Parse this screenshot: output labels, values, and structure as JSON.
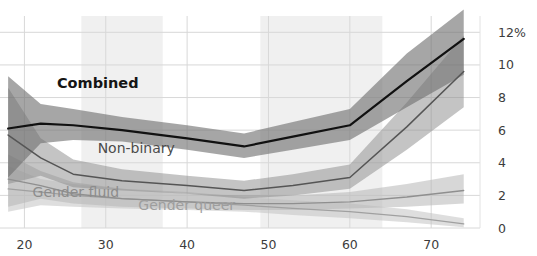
{
  "chart_data": {
    "type": "line",
    "title": "",
    "subtitle": "",
    "xlabel": "",
    "ylabel": "",
    "xlim": [
      17,
      76
    ],
    "ylim": [
      0,
      13
    ],
    "grid": true,
    "legend_position": "inline-labels",
    "y_ticks": [
      {
        "value": 12,
        "label": "12%"
      },
      {
        "value": 10,
        "label": "10"
      },
      {
        "value": 8,
        "label": "8"
      },
      {
        "value": 6,
        "label": "6"
      },
      {
        "value": 4,
        "label": "4"
      },
      {
        "value": 2,
        "label": "2"
      },
      {
        "value": 0,
        "label": "0"
      }
    ],
    "x_ticks": [
      {
        "value": 20,
        "label": "20"
      },
      {
        "value": 30,
        "label": "30"
      },
      {
        "value": 40,
        "label": "40"
      },
      {
        "value": 50,
        "label": "50"
      },
      {
        "value": 60,
        "label": "60"
      },
      {
        "value": 70,
        "label": "70"
      }
    ],
    "shaded_x_bands": [
      {
        "from": 27,
        "to": 37
      },
      {
        "from": 49,
        "to": 64
      }
    ],
    "x": [
      18,
      22,
      26,
      32,
      40,
      47,
      53,
      60,
      67,
      74
    ],
    "series": [
      {
        "name": "Combined",
        "label": "Combined",
        "color": "#111111",
        "stroke_width": 2.2,
        "band_color": "#6f6f6f",
        "band_opacity": 0.62,
        "label_x": 24,
        "label_y": 8.6,
        "values": [
          6.1,
          6.4,
          6.3,
          6.0,
          5.5,
          5.0,
          5.6,
          6.3,
          9.0,
          11.6
        ],
        "band_low": [
          3.1,
          5.2,
          5.4,
          5.3,
          4.8,
          4.3,
          4.8,
          5.4,
          7.4,
          9.4
        ],
        "band_high": [
          9.3,
          7.6,
          7.3,
          6.8,
          6.3,
          5.8,
          6.5,
          7.3,
          10.7,
          13.4
        ]
      },
      {
        "name": "Non-binary",
        "label": "Non-binary",
        "color": "#555555",
        "stroke_width": 1.5,
        "band_color": "#8a8a8a",
        "band_opacity": 0.5,
        "label_x": 29,
        "label_y": 4.6,
        "values": [
          5.7,
          4.3,
          3.3,
          2.9,
          2.6,
          2.3,
          2.6,
          3.1,
          6.2,
          9.6
        ],
        "band_low": [
          2.7,
          3.2,
          2.5,
          2.3,
          2.1,
          1.8,
          2.0,
          2.4,
          4.8,
          7.4
        ],
        "band_high": [
          8.6,
          5.5,
          4.2,
          3.6,
          3.2,
          2.9,
          3.3,
          3.9,
          7.7,
          11.8
        ]
      },
      {
        "name": "Gender fluid",
        "label": "Gender fluid",
        "color": "#8f8f8f",
        "stroke_width": 1.3,
        "band_color": "#b6b6b6",
        "band_opacity": 0.55,
        "label_x": 21,
        "label_y": 1.9,
        "values": [
          3.0,
          2.6,
          2.1,
          1.8,
          1.6,
          1.5,
          1.5,
          1.6,
          1.9,
          2.3
        ],
        "band_low": [
          1.3,
          1.8,
          1.5,
          1.3,
          1.2,
          1.1,
          1.1,
          1.2,
          1.3,
          1.5
        ],
        "band_high": [
          4.5,
          3.5,
          2.8,
          2.4,
          2.1,
          2.0,
          2.0,
          2.2,
          2.7,
          3.3
        ]
      },
      {
        "name": "Gender queer",
        "label": "Gender queer",
        "color": "#a0a0a0",
        "stroke_width": 1.3,
        "band_color": "#c2c2c2",
        "band_opacity": 0.55,
        "label_x": 34,
        "label_y": 1.1,
        "values": [
          2.4,
          2.2,
          2.0,
          1.8,
          1.6,
          1.4,
          1.2,
          1.0,
          0.7,
          0.25
        ],
        "band_low": [
          1.0,
          1.4,
          1.3,
          1.2,
          1.1,
          1.0,
          0.8,
          0.6,
          0.35,
          0.05
        ],
        "band_high": [
          3.8,
          3.0,
          2.7,
          2.4,
          2.2,
          1.9,
          1.7,
          1.5,
          1.15,
          0.6
        ]
      }
    ]
  },
  "axis": {
    "right_axis_unit_label": "12%",
    "x_axis_caption": "",
    "y_axis_caption": ""
  },
  "colors": {
    "background": "#ffffff",
    "gridline": "#d8d8d8",
    "band_shade": "#f0f0f0",
    "tick_text": "#3c3c3c"
  }
}
